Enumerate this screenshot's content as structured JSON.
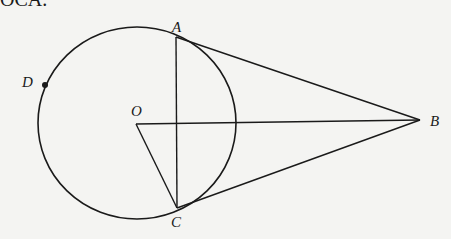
{
  "caption_fragment": "OCA.",
  "figure": {
    "circle": {
      "center": "O",
      "cx": 137,
      "cy": 124,
      "rx": 99,
      "ry": 96
    },
    "points": {
      "A": {
        "x": 176,
        "y": 37,
        "label": "A"
      },
      "B": {
        "x": 420,
        "y": 120,
        "label": "B"
      },
      "C": {
        "x": 177,
        "y": 208,
        "label": "C"
      },
      "O": {
        "x": 136,
        "y": 124,
        "label": "O"
      },
      "D": {
        "x": 44,
        "y": 85,
        "label": "D"
      }
    },
    "segments": [
      "AB",
      "CB",
      "OB",
      "AC",
      "OC"
    ],
    "stroke_color": "#1a1a1a",
    "background_color": "#f4f4f2"
  }
}
